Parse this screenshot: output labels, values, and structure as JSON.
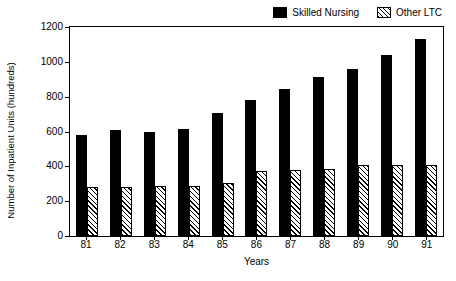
{
  "chart_data": {
    "type": "bar",
    "title": "",
    "xlabel": "Years",
    "ylabel": "Number of Inpatient Units (hundreds)",
    "ylim": [
      0,
      1200
    ],
    "yticks": [
      0,
      200,
      400,
      600,
      800,
      1000,
      1200
    ],
    "ytick_labels": [
      "0",
      "200",
      "400",
      "600",
      "800",
      "1000",
      "1200"
    ],
    "grid": false,
    "legend_position": "top-right",
    "categories": [
      "81",
      "82",
      "83",
      "84",
      "85",
      "86",
      "87",
      "88",
      "89",
      "90",
      "91"
    ],
    "series": [
      {
        "name": "Skilled Nursing",
        "fill": "solid-black",
        "color": "#000000",
        "values": [
          580,
          608,
          598,
          617,
          706,
          783,
          845,
          914,
          958,
          1042,
          1130
        ]
      },
      {
        "name": "Other LTC",
        "fill": "diagonal-hatch",
        "color": "#000000",
        "values": [
          281,
          280,
          285,
          290,
          305,
          374,
          378,
          385,
          409,
          408,
          405
        ]
      }
    ]
  }
}
